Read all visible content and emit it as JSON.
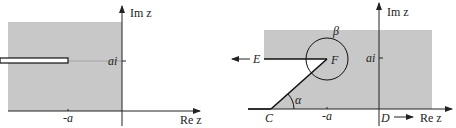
{
  "colors": {
    "shade": "#c8c8c8",
    "line": "#111111",
    "axis": "#222222",
    "background": "#ffffff"
  },
  "left_diagram": {
    "axis_labels": {
      "imaginary": "Im z",
      "real": "Re z"
    },
    "tick_labels": {
      "imag_tick": "ai",
      "real_tick": "-a"
    },
    "description": "Shaded left half-plane strip with a slit from -infinity to -a+ai"
  },
  "right_diagram": {
    "axis_labels": {
      "imaginary": "Im z",
      "real": "Re z"
    },
    "tick_labels": {
      "imag_tick": "ai",
      "real_tick": "-a"
    },
    "points": {
      "C": "C",
      "D": "D",
      "E": "E",
      "F": "F"
    },
    "angles": {
      "alpha": "α",
      "beta": "β"
    },
    "description": "Polygon C-F-E with angle alpha at C and beta at F, D toward +infinity on real axis"
  }
}
